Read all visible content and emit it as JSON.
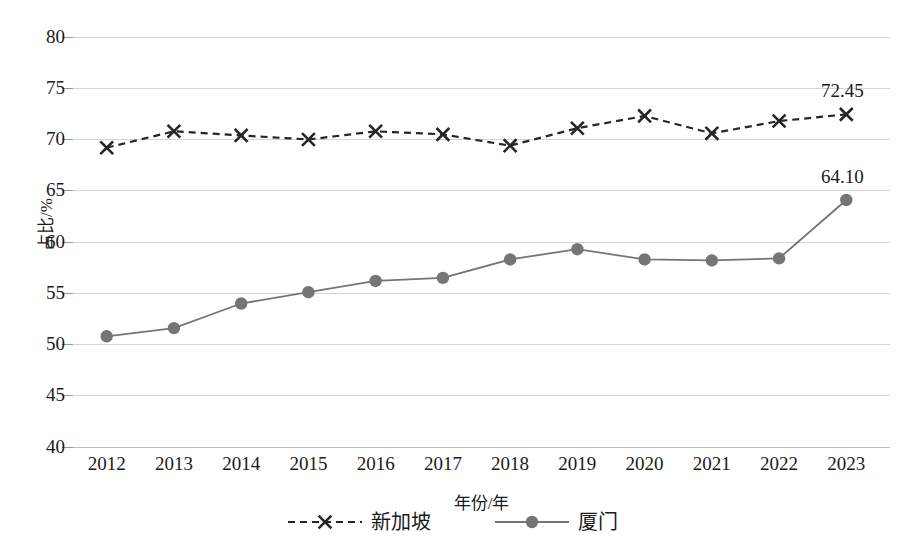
{
  "chart_data": {
    "type": "line",
    "title": "",
    "xlabel": "年份/年",
    "ylabel": "占比/%",
    "categories": [
      "2012",
      "2013",
      "2014",
      "2015",
      "2016",
      "2017",
      "2018",
      "2019",
      "2020",
      "2021",
      "2022",
      "2023"
    ],
    "ylim": [
      40,
      80
    ],
    "yticks": [
      80,
      75,
      70,
      65,
      60,
      55,
      50,
      45,
      40
    ],
    "ytick_labels": [
      "80",
      "75",
      "70",
      "65",
      "60",
      "55",
      "50",
      "45",
      "40"
    ],
    "grid": true,
    "legend_position": "bottom",
    "series": [
      {
        "name": "新加坡",
        "style": "dashed",
        "marker": "x",
        "color": "#262626",
        "values": [
          69.2,
          70.8,
          70.4,
          70.0,
          70.8,
          70.5,
          69.4,
          71.1,
          72.3,
          70.6,
          71.8,
          72.45
        ],
        "labels": [
          null,
          null,
          null,
          null,
          null,
          null,
          null,
          null,
          null,
          null,
          null,
          "72.45"
        ]
      },
      {
        "name": "厦门",
        "style": "solid",
        "marker": "circle",
        "color": "#757575",
        "values": [
          50.8,
          51.6,
          54.0,
          55.1,
          56.2,
          56.5,
          58.3,
          59.3,
          58.3,
          58.2,
          58.4,
          64.1
        ],
        "labels": [
          null,
          null,
          null,
          null,
          null,
          null,
          null,
          null,
          null,
          null,
          null,
          "64.10"
        ]
      }
    ],
    "annotations": [
      {
        "text": "72.45",
        "series": "新加坡",
        "category": "2023"
      },
      {
        "text": "64.10",
        "series": "厦门",
        "category": "2023"
      }
    ]
  }
}
